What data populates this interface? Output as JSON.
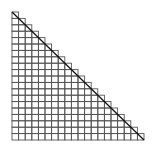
{
  "diagram": {
    "type": "staircase-grid-triangle",
    "rows": 20,
    "origin": [
      12,
      12
    ],
    "cell_width": 6.6,
    "cell_height": 6.4,
    "grid_color": "#555555",
    "diagonal_color": "#111111",
    "background": "#ffffff"
  }
}
